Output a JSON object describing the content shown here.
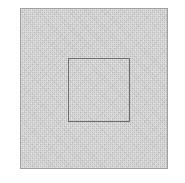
{
  "figure": {
    "canvas": {
      "width": 185,
      "height": 183,
      "background_color": "#ffffff"
    },
    "shapes": [
      {
        "name": "outer-square",
        "kind": "square",
        "x": 20,
        "y": 8,
        "width": 148,
        "height": 161,
        "fill_color": "#c5c5c5",
        "stroke_color": "#a0a0a0",
        "stroke_width": 1,
        "texture": "halftone-dither"
      },
      {
        "name": "inner-square",
        "kind": "square",
        "x": 67,
        "y": 57,
        "width": 62,
        "height": 64,
        "fill_color": "none",
        "stroke_color": "#6f6f6f",
        "stroke_width": 1.5,
        "texture": "none"
      }
    ],
    "labels": [],
    "annotations": []
  }
}
